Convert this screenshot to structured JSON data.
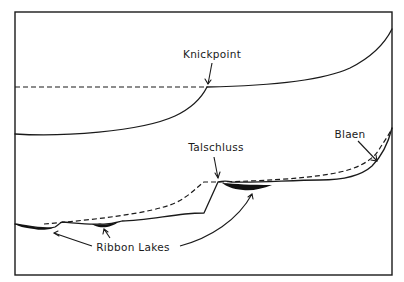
{
  "figure": {
    "panels": [
      {
        "name": "river-profile",
        "labels": [
          {
            "id": "knickpoint",
            "text": "Knickpoint"
          }
        ]
      },
      {
        "name": "glacial-trough-profile",
        "labels": [
          {
            "id": "talschluss",
            "text": "Talschluss"
          },
          {
            "id": "blaen",
            "text": "Blaen"
          },
          {
            "id": "ribbon_lakes",
            "text": "Ribbon  Lakes"
          }
        ]
      }
    ],
    "line_styles": {
      "solid": "current profile",
      "dashed": "former / projected profile"
    },
    "colors": {
      "ink": "#1a1a1a",
      "background": "#ffffff",
      "lake_fill": "#111111"
    }
  }
}
